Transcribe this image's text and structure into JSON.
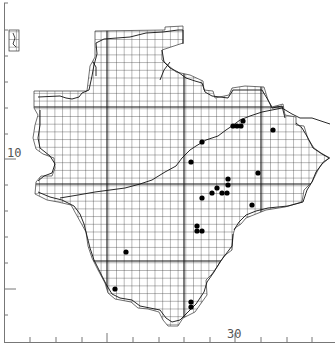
{
  "map": {
    "type": "dot-distribution-grid-map",
    "grid_step_px": 7.7,
    "colors": {
      "grid": "#222222",
      "coast": "#111111",
      "dot": "#000000",
      "axis": "#666666",
      "background": "#ffffff"
    },
    "axis_labels": {
      "y_label": "10",
      "x_label": "30"
    },
    "records": [
      {
        "x": 233,
        "y": 126
      },
      {
        "x": 237,
        "y": 126
      },
      {
        "x": 241,
        "y": 126
      },
      {
        "x": 243,
        "y": 121
      },
      {
        "x": 273,
        "y": 130
      },
      {
        "x": 202,
        "y": 142
      },
      {
        "x": 191,
        "y": 162
      },
      {
        "x": 258,
        "y": 173
      },
      {
        "x": 228,
        "y": 179
      },
      {
        "x": 228,
        "y": 185
      },
      {
        "x": 217,
        "y": 188
      },
      {
        "x": 212,
        "y": 193
      },
      {
        "x": 222,
        "y": 193
      },
      {
        "x": 227,
        "y": 193
      },
      {
        "x": 202,
        "y": 198
      },
      {
        "x": 252,
        "y": 205
      },
      {
        "x": 197,
        "y": 226
      },
      {
        "x": 197,
        "y": 231
      },
      {
        "x": 202,
        "y": 231
      },
      {
        "x": 126,
        "y": 252
      },
      {
        "x": 115,
        "y": 289
      },
      {
        "x": 191,
        "y": 302
      },
      {
        "x": 191,
        "y": 307
      }
    ]
  }
}
